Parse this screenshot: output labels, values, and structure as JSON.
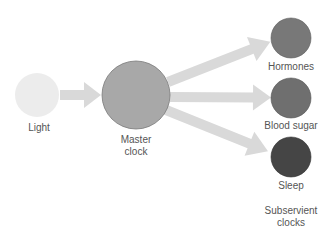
{
  "diagram": {
    "title": "",
    "colors": {
      "background": "#ffffff",
      "arrow": "#d9d9d9",
      "light": "#ececec",
      "master": "#a8a8a8",
      "master_outline": "#7a7a7a",
      "hormones": "#787878",
      "blood_sugar": "#6f6f6f",
      "sleep": "#454545",
      "text": "#555555"
    },
    "nodes": {
      "light": {
        "label": "Light",
        "cx": 37,
        "cy": 95,
        "r": 22
      },
      "master": {
        "label_line1": "Master",
        "label_line2": "clock",
        "cx": 136,
        "cy": 95,
        "r": 34
      },
      "hormones": {
        "label": "Hormones",
        "cx": 291,
        "cy": 38,
        "r": 20
      },
      "blood_sugar": {
        "label": "Blood sugar",
        "cx": 291,
        "cy": 98,
        "r": 20
      },
      "sleep": {
        "label": "Sleep",
        "cx": 291,
        "cy": 157,
        "r": 20
      }
    },
    "group_label": {
      "line1": "Subservient",
      "line2": "clocks"
    },
    "edges": [
      {
        "from": "light",
        "to": "master"
      },
      {
        "from": "master",
        "to": "hormones"
      },
      {
        "from": "master",
        "to": "blood_sugar"
      },
      {
        "from": "master",
        "to": "sleep"
      }
    ]
  }
}
